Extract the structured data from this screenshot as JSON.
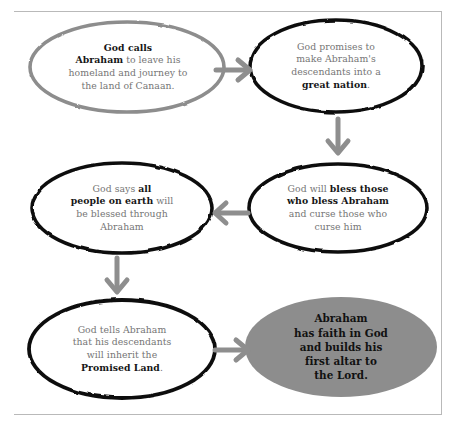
{
  "diagram": {
    "colors": {
      "ink_black": "#161616",
      "body_gray": "#757575",
      "outline_black": "#121212",
      "outline_gray": "#8a8a8a",
      "arrow_gray": "#8e8e8e",
      "fill_gray": "#8d8d8d",
      "rule_gray": "#b9b9b9",
      "background": "#ffffff"
    },
    "nodes": [
      {
        "id": "node-god-calls-abraham",
        "shape": "ellipse",
        "outline": "gray",
        "fill": "none",
        "text": "God calls Abraham to leave his homeland and journey to the land of Canaan.",
        "lines": [
          [
            {
              "t": "God calls",
              "b": true
            }
          ],
          [
            {
              "t": "Abraham",
              "b": true
            },
            {
              "t": " to leave his",
              "b": false
            }
          ],
          [
            {
              "t": "homeland and journey to",
              "b": false
            }
          ],
          [
            {
              "t": "the land of Canaan",
              "b": false
            },
            {
              "t": ".",
              "b": false
            }
          ]
        ]
      },
      {
        "id": "node-great-nation",
        "shape": "ellipse",
        "outline": "black",
        "fill": "none",
        "text": "God promises to make Abraham's descendants into a great nation.",
        "lines": [
          [
            {
              "t": "God promises to",
              "b": false
            }
          ],
          [
            {
              "t": "make Abraham's",
              "b": false
            }
          ],
          [
            {
              "t": "descendants into a",
              "b": false
            }
          ],
          [
            {
              "t": "great nation",
              "b": true
            },
            {
              "t": ".",
              "b": false
            }
          ]
        ]
      },
      {
        "id": "node-bless-those-who-bless",
        "shape": "ellipse",
        "outline": "black",
        "fill": "none",
        "text": "God will bless those who bless Abraham and curse those who curse him",
        "lines": [
          [
            {
              "t": "God will ",
              "b": false
            },
            {
              "t": "bless those",
              "b": true
            }
          ],
          [
            {
              "t": "who bless Abraham",
              "b": true
            }
          ],
          [
            {
              "t": "and curse those who",
              "b": false
            }
          ],
          [
            {
              "t": "curse him",
              "b": false
            }
          ]
        ]
      },
      {
        "id": "node-all-people-on-earth",
        "shape": "ellipse",
        "outline": "black",
        "fill": "none",
        "text": "God says all people on earth will be blessed through Abraham",
        "lines": [
          [
            {
              "t": "God says ",
              "b": false
            },
            {
              "t": "all",
              "b": true
            }
          ],
          [
            {
              "t": "people on earth",
              "b": true
            },
            {
              "t": " will",
              "b": false
            }
          ],
          [
            {
              "t": "be blessed through",
              "b": false
            }
          ],
          [
            {
              "t": "Abraham",
              "b": false
            }
          ]
        ]
      },
      {
        "id": "node-promised-land",
        "shape": "ellipse",
        "outline": "black",
        "fill": "none",
        "text": "God tells Abraham that his descendants will inherit the Promised Land.",
        "lines": [
          [
            {
              "t": "God tells Abraham",
              "b": false
            }
          ],
          [
            {
              "t": "that his descendants",
              "b": false
            }
          ],
          [
            {
              "t": "will inherit the",
              "b": false
            }
          ],
          [
            {
              "t": "Promised Land",
              "b": true
            },
            {
              "t": ".",
              "b": false
            }
          ]
        ]
      },
      {
        "id": "node-abraham-has-faith",
        "shape": "ellipse",
        "outline": "none",
        "fill": "gray",
        "text": "Abraham has faith in God and builds his first altar to the Lord.",
        "lines": [
          [
            {
              "t": "Abraham",
              "b": true
            }
          ],
          [
            {
              "t": "has faith in God",
              "b": true
            }
          ],
          [
            {
              "t": "and builds his",
              "b": true
            }
          ],
          [
            {
              "t": "first altar to",
              "b": true
            }
          ],
          [
            {
              "t": "the Lord",
              "b": true
            },
            {
              "t": ".",
              "b": false
            }
          ]
        ]
      }
    ],
    "arrows": [
      {
        "id": "arrow-1",
        "from": "node-god-calls-abraham",
        "to": "node-great-nation",
        "direction": "right"
      },
      {
        "id": "arrow-2",
        "from": "node-great-nation",
        "to": "node-bless-those-who-bless",
        "direction": "down"
      },
      {
        "id": "arrow-3",
        "from": "node-bless-those-who-bless",
        "to": "node-all-people-on-earth",
        "direction": "left"
      },
      {
        "id": "arrow-4",
        "from": "node-all-people-on-earth",
        "to": "node-promised-land",
        "direction": "down"
      },
      {
        "id": "arrow-5",
        "from": "node-promised-land",
        "to": "node-abraham-has-faith",
        "direction": "right"
      }
    ]
  }
}
